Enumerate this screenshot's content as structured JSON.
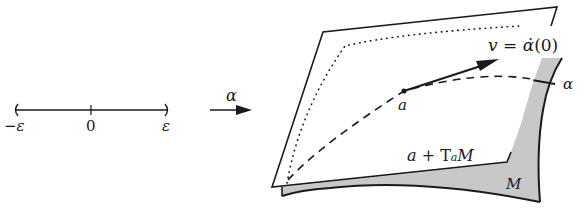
{
  "figure": {
    "interval": {
      "left_label": "−ε",
      "center_label": "0",
      "right_label": "ε"
    },
    "map_label": "α",
    "point_label": "a",
    "vector_label_lhs": "v = ",
    "vector_label_alpha": "α̇",
    "vector_label_arg": "(0)",
    "tangent_plane_label_a": "a",
    "tangent_plane_label_plus": " + ",
    "tangent_plane_label_T": "T",
    "tangent_plane_label_sub": "a",
    "tangent_plane_label_M": "M",
    "curve_label": "α",
    "manifold_label": "M",
    "colors": {
      "ink": "#1a1a1a",
      "manifold_fill": "#c8c8c8",
      "plane_fill": "#ffffff"
    }
  }
}
